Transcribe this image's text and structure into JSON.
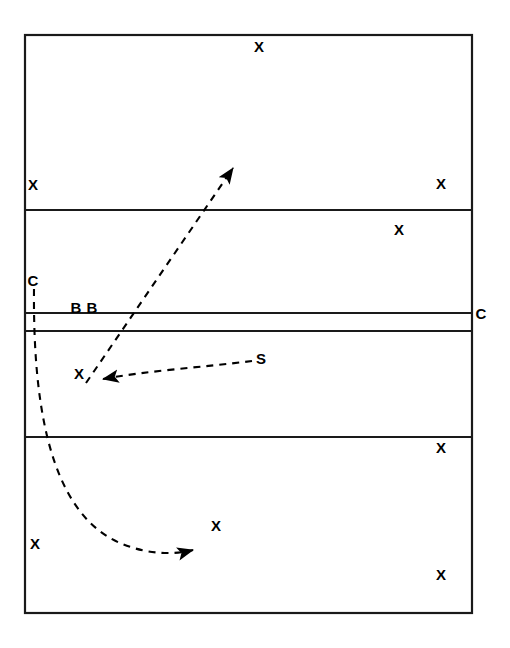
{
  "diagram": {
    "type": "volleyball-court-play-diagram",
    "width": 510,
    "height": 648,
    "background_color": "#ffffff",
    "line_color": "#1a1a1a",
    "text_color": "#000000"
  },
  "court": {
    "outer_boundary": {
      "x": 25,
      "y": 35,
      "width": 447,
      "height": 578
    },
    "lines": [
      {
        "name": "far-attack-line",
        "y": 210,
        "x1": 25,
        "x2": 472
      },
      {
        "name": "net-line-far",
        "y": 313,
        "x1": 25,
        "x2": 472
      },
      {
        "name": "net-line-near",
        "y": 331,
        "x1": 25,
        "x2": 472
      },
      {
        "name": "near-attack-line",
        "y": 437,
        "x1": 25,
        "x2": 472
      }
    ]
  },
  "markers": [
    {
      "id": "x-far-back-center",
      "label": "X",
      "x": 259,
      "y": 46
    },
    {
      "id": "x-far-back-left",
      "label": "X",
      "x": 33,
      "y": 184
    },
    {
      "id": "x-far-back-right",
      "label": "X",
      "x": 441,
      "y": 183
    },
    {
      "id": "x-far-front-right",
      "label": "X",
      "x": 399,
      "y": 229
    },
    {
      "id": "c-left",
      "label": "C",
      "x": 33,
      "y": 280
    },
    {
      "id": "b-left",
      "label": "B",
      "x": 76,
      "y": 307
    },
    {
      "id": "b-right",
      "label": "B",
      "x": 92,
      "y": 307
    },
    {
      "id": "c-right",
      "label": "C",
      "x": 481,
      "y": 313
    },
    {
      "id": "x-near-front-left",
      "label": "X",
      "x": 79,
      "y": 373
    },
    {
      "id": "s-setter",
      "label": "S",
      "x": 261,
      "y": 358
    },
    {
      "id": "x-near-back-right-top",
      "label": "X",
      "x": 441,
      "y": 447
    },
    {
      "id": "x-near-back-left",
      "label": "X",
      "x": 35,
      "y": 543
    },
    {
      "id": "x-near-back-center",
      "label": "X",
      "x": 216,
      "y": 525
    },
    {
      "id": "x-near-back-right-bottom",
      "label": "X",
      "x": 441,
      "y": 574
    }
  ],
  "arrows": [
    {
      "id": "attack-arrow",
      "description": "dashed straight arrow from near front-left X up across the net into far court",
      "style": "dashed",
      "path": "M 86 383 L 236 164",
      "arrowhead_at": [
        236,
        164
      ]
    },
    {
      "id": "set-arrow",
      "description": "dashed curved arrow from setter S to near front-left attacker",
      "style": "dashed",
      "path": "M 253 360 C 200 368 140 372 97 379",
      "arrowhead_at": [
        97,
        379
      ]
    },
    {
      "id": "c-movement-arrow",
      "description": "dashed curved arrow from C on left sideline down and across to near back center",
      "style": "dashed",
      "path": "M 34 289 C 34 420 60 525 142 548 C 165 554 185 552 199 549",
      "arrowhead_at": [
        199,
        549
      ]
    }
  ]
}
